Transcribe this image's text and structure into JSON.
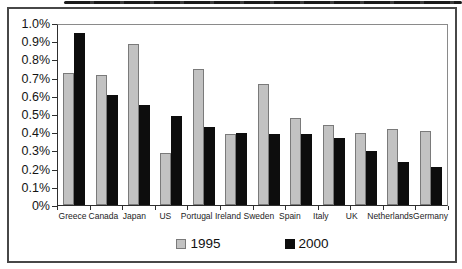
{
  "colors": {
    "bar_1995_fill": "#c2c2c2",
    "bar_1995_border": "#7a7a7a",
    "bar_2000_fill": "#0d0d0d",
    "bar_2000_border": "#0d0d0d",
    "frame_border": "#474747",
    "axis": "#2e2e2e"
  },
  "legend": {
    "item_1995": "1995",
    "item_2000": "2000"
  },
  "chart_data": {
    "type": "bar",
    "title": "",
    "xlabel": "",
    "ylabel": "",
    "grid": false,
    "legend_position": "bottom-center",
    "ylim": [
      0,
      1.0
    ],
    "y_ticks": [
      "1.0%",
      "0.9%",
      "0.8%",
      "0.7%",
      "0.6%",
      "0.5%",
      "0.4%",
      "0.3%",
      "0.2%",
      "0.1%",
      "0%"
    ],
    "categories": [
      "Greece",
      "Canada",
      "Japan",
      "US",
      "Portugal",
      "Ireland",
      "Sweden",
      "Spain",
      "Italy",
      "UK",
      "Netherlands",
      "Germany"
    ],
    "series": [
      {
        "name": "1995",
        "color": "#c2c2c2",
        "border": "#7a7a7a",
        "values": [
          0.73,
          0.72,
          0.89,
          0.29,
          0.75,
          0.39,
          0.67,
          0.48,
          0.44,
          0.4,
          0.42,
          0.41
        ]
      },
      {
        "name": "2000",
        "color": "#0d0d0d",
        "border": "#0d0d0d",
        "values": [
          0.95,
          0.61,
          0.55,
          0.49,
          0.43,
          0.4,
          0.39,
          0.39,
          0.37,
          0.3,
          0.24,
          0.21
        ]
      }
    ]
  }
}
